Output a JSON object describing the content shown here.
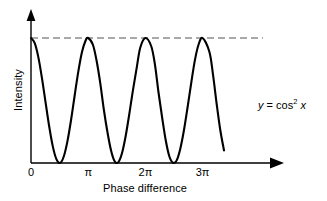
{
  "chart_data": {
    "type": "line",
    "title": "",
    "subtitle": "",
    "xlabel": "Phase difference",
    "ylabel": "Intensity",
    "xtick_labels": [
      "0",
      "π",
      "2π",
      "3π"
    ],
    "xtick_values": [
      0,
      3.14159,
      6.28319,
      9.42478
    ],
    "ytick_labels": [],
    "xlim": [
      0,
      10.6
    ],
    "ylim": [
      0,
      1.18
    ],
    "grid": false,
    "legend": null,
    "annotations": [
      {
        "name": "curve-equation",
        "text": "y = cos² x",
        "text_lhs": "y",
        "text_op": " = cos",
        "text_exp": "2",
        "text_var": " x"
      }
    ],
    "reference_lines": [
      {
        "name": "max-intensity-dashed",
        "orientation": "horizontal",
        "value": 1,
        "style": "dashed",
        "color": "#555555"
      }
    ],
    "series": [
      {
        "name": "y = cos^2 x",
        "color": "#000000",
        "linewidth": 2,
        "function": "cos(x)^2",
        "x": [
          0.0,
          0.2,
          0.4,
          0.6,
          0.8,
          1.0,
          1.2,
          1.4,
          1.6,
          1.8,
          2.0,
          2.2,
          2.4,
          2.6,
          2.8,
          3.0,
          3.14159,
          3.4,
          3.6,
          3.8,
          4.0,
          4.2,
          4.4,
          4.6,
          4.8,
          5.0,
          5.2,
          5.4,
          5.6,
          5.8,
          6.0,
          6.28319,
          6.6,
          6.8,
          7.0,
          7.2,
          7.4,
          7.6,
          7.8,
          8.0,
          8.2,
          8.4,
          8.6,
          8.8,
          9.0,
          9.2,
          9.42478,
          9.8,
          10.0,
          10.2,
          10.4,
          10.6
        ],
        "y": [
          1.0,
          0.961,
          0.849,
          0.681,
          0.485,
          0.292,
          0.131,
          0.029,
          0.001,
          0.052,
          0.173,
          0.344,
          0.542,
          0.733,
          0.888,
          0.98,
          1.0,
          0.946,
          0.82,
          0.643,
          0.428,
          0.246,
          0.098,
          0.012,
          0.007,
          0.08,
          0.216,
          0.393,
          0.583,
          0.757,
          0.922,
          1.0,
          0.936,
          0.795,
          0.568,
          0.366,
          0.182,
          0.052,
          0.002,
          0.021,
          0.115,
          0.262,
          0.446,
          0.64,
          0.821,
          0.946,
          1.0,
          0.888,
          0.703,
          0.47,
          0.26,
          0.101
        ],
        "maxima": [
          {
            "x_label": "0",
            "x": 0,
            "y": 1
          },
          {
            "x_label": "2π",
            "x": 6.28319,
            "y": 1
          }
        ],
        "minima": [
          {
            "x_label": "π",
            "x": 3.14159,
            "y": 0
          },
          {
            "x_label": "3π",
            "x": 9.42478,
            "y": 0
          }
        ],
        "end_x": 10.6,
        "end_y": 0.63
      }
    ],
    "axis_arrows": {
      "x_axis": "arrow-right",
      "y_axis": "arrow-up"
    },
    "colors": {
      "curve": "#000000",
      "axis": "#000000",
      "dashed_reference": "#555555",
      "background": "#ffffff",
      "text": "#000000"
    }
  }
}
